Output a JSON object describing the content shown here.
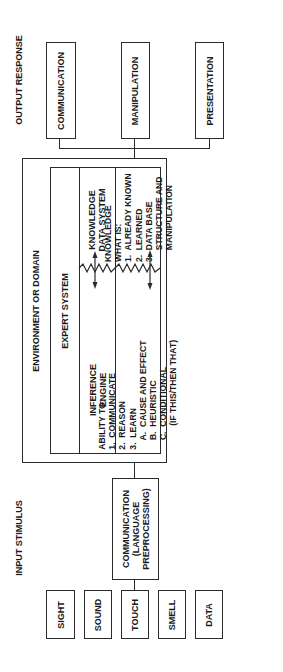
{
  "diagram": {
    "orientation": "rotated -90 degrees (reads bottom-to-top)",
    "input": {
      "title": "INPUT STIMULUS",
      "sources": [
        "SIGHT",
        "SOUND",
        "TOUCH",
        "SMELL",
        "DATA"
      ],
      "preprocessor": "COMMUNICATION\n(LANGUAGE\nPREPROCESSING)"
    },
    "environment": {
      "title": "ENVIRONMENT OR DOMAIN",
      "expert_system": {
        "title": "EXPERT SYSTEM",
        "inference_engine": {
          "title": "INFERENCE\nENGINE",
          "ability_text": "ABILITY TO:\n1.  COMMUNICATE\n2.  REASON\n3.  LEARN\n    A.  CAUSE AND EFFECT\n    B.  HEURISTIC\n    C.  CONDITIONAL\n          (IF THIS/THEN THAT)"
        },
        "knowledge_data_system": {
          "title": "KNOWLEDGE\nDATA SYSTEM",
          "knowledge_text": "KNOWLEDGE\nWHAT IS:\n1.  ALREADY KNOWN\n2.  LEARNED\n3.  DATA BASE\n     STRUCTURE AND\n     MANIPULATION"
        },
        "connector": "bidirectional-arrow-icon"
      }
    },
    "output": {
      "title": "OUTPUT RESPONSE",
      "responses": [
        "COMMUNICATION",
        "MANIPULATION",
        "PRESENTATION"
      ]
    },
    "colors": {
      "line": "#2a2a2a",
      "background": "#ffffff",
      "text": "#1a1a1a"
    }
  }
}
